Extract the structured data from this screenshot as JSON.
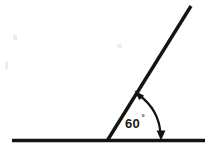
{
  "figure": {
    "kind": "geometry-angle-diagram",
    "background_color": "#ffffff",
    "ink_color": "#141414",
    "width": 218,
    "height": 152,
    "angle_label": "60",
    "degree_symbol": "°",
    "angle_value": 60,
    "angle_unit": "degrees",
    "vertex": {
      "x": 108,
      "y": 140
    },
    "baseline": {
      "x1": 12,
      "y1": 140,
      "x2": 205,
      "y2": 140,
      "label": "horizontal-ray"
    },
    "ray": {
      "x1": 108,
      "y1": 140,
      "x2": 191,
      "y2": 6,
      "label": "inclined-ray"
    },
    "arc": {
      "radius": 52,
      "start_label": "on-inclined-ray",
      "end_label": "on-horizontal-ray",
      "arrowheads": "both-ends"
    },
    "label_position": {
      "x": 126,
      "y": 127
    }
  }
}
